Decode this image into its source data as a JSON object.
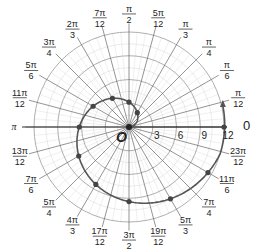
{
  "chart_data": {
    "type": "line",
    "subtype": "polar",
    "title": "",
    "equation": "r = 2θ",
    "center_label": "O",
    "polar_axis_label": "0",
    "theta_range": [
      0,
      6.283185307
    ],
    "r_max": 12,
    "radial_ticks": [
      3,
      6,
      9,
      12
    ],
    "radial_tick_labels": [
      "3",
      "6",
      "9",
      "12"
    ],
    "minor_radial_step": 1.5,
    "angle_step_deg": 15,
    "angle_labels": [
      {
        "deg": 15,
        "num": "π",
        "den": "12"
      },
      {
        "deg": 30,
        "num": "π",
        "den": "6"
      },
      {
        "deg": 45,
        "num": "π",
        "den": "4"
      },
      {
        "deg": 60,
        "num": "π",
        "den": "3"
      },
      {
        "deg": 75,
        "num": "5π",
        "den": "12"
      },
      {
        "deg": 90,
        "num": "π",
        "den": "2"
      },
      {
        "deg": 105,
        "num": "7π",
        "den": "12"
      },
      {
        "deg": 120,
        "num": "2π",
        "den": "3"
      },
      {
        "deg": 135,
        "num": "3π",
        "den": "4"
      },
      {
        "deg": 150,
        "num": "5π",
        "den": "6"
      },
      {
        "deg": 165,
        "num": "11π",
        "den": "12"
      },
      {
        "deg": 180,
        "num": "π",
        "den": ""
      },
      {
        "deg": 195,
        "num": "13π",
        "den": "12"
      },
      {
        "deg": 210,
        "num": "7π",
        "den": "6"
      },
      {
        "deg": 225,
        "num": "5π",
        "den": "4"
      },
      {
        "deg": 240,
        "num": "4π",
        "den": "3"
      },
      {
        "deg": 255,
        "num": "17π",
        "den": "12"
      },
      {
        "deg": 270,
        "num": "3π",
        "den": "2"
      },
      {
        "deg": 285,
        "num": "19π",
        "den": "12"
      },
      {
        "deg": 300,
        "num": "5π",
        "den": "3"
      },
      {
        "deg": 315,
        "num": "7π",
        "den": "4"
      },
      {
        "deg": 330,
        "num": "11π",
        "den": "6"
      },
      {
        "deg": 345,
        "num": "23π",
        "den": "12"
      }
    ],
    "marked_points_deg": [
      60,
      90,
      120,
      150,
      180,
      210,
      240,
      270,
      300,
      330,
      360
    ],
    "marked_points": [
      {
        "theta": "π/3",
        "r": 2.09
      },
      {
        "theta": "π/2",
        "r": 3.14
      },
      {
        "theta": "2π/3",
        "r": 4.19
      },
      {
        "theta": "5π/6",
        "r": 5.24
      },
      {
        "theta": "π",
        "r": 6.28
      },
      {
        "theta": "7π/6",
        "r": 7.33
      },
      {
        "theta": "4π/3",
        "r": 8.38
      },
      {
        "theta": "3π/2",
        "r": 9.42
      },
      {
        "theta": "5π/3",
        "r": 10.47
      },
      {
        "theta": "11π/6",
        "r": 11.52
      },
      {
        "theta": "2π",
        "r": 12.57
      }
    ],
    "grid": true,
    "colors": {
      "grid": "#9a9a9a",
      "minor_grid": "#d6d6d6",
      "axis": "#333333",
      "curve": "#555555",
      "point": "#444444"
    }
  },
  "top_text": ""
}
